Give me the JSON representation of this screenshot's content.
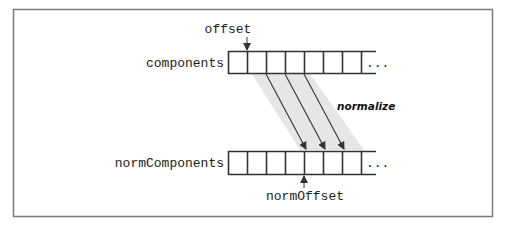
{
  "diagram": {
    "top_array": {
      "label": "components",
      "cell_count": 7,
      "ellipsis": "...",
      "pointer_label": "offset"
    },
    "bottom_array": {
      "label": "normComponents",
      "cell_count": 7,
      "ellipsis": "...",
      "pointer_label": "normOffset"
    },
    "operation_label": "normalize",
    "mapped_arrows": [
      {
        "from_cell_boundary": 2,
        "to_cell_boundary": 4
      },
      {
        "from_cell_boundary": 3,
        "to_cell_boundary": 5
      },
      {
        "from_cell_boundary": 4,
        "to_cell_boundary": 6
      }
    ],
    "colors": {
      "frame": "#7a7a7a",
      "lines": "#333333",
      "band": "#e6e6e6"
    }
  }
}
